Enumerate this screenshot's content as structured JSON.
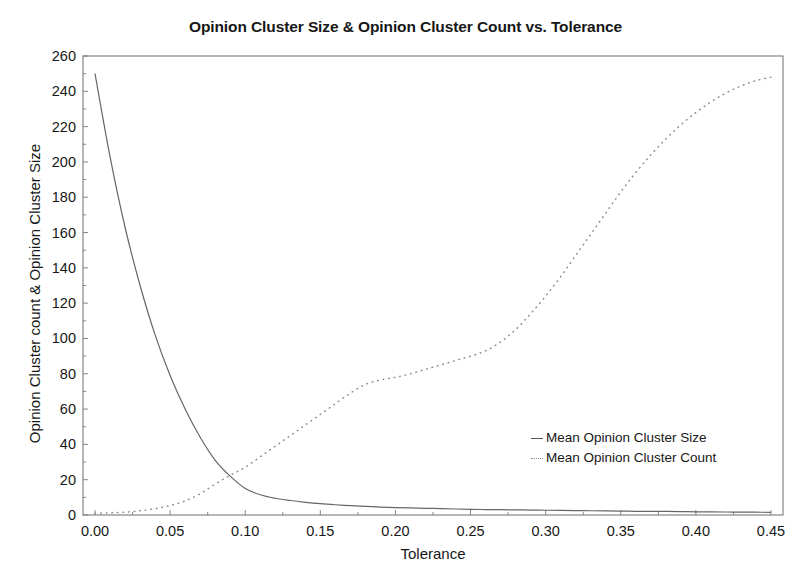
{
  "chart_data": {
    "type": "line",
    "title": "Opinion Cluster Size & Opinion Cluster Count vs. Tolerance",
    "xlabel": "Tolerance",
    "ylabel": "Opinion Cluster count & Opinion Cluster Size",
    "xlim": [
      -0.008,
      0.458
    ],
    "ylim": [
      0,
      260
    ],
    "grid": false,
    "legend_position": "center-right-inside",
    "xticks": [
      0.0,
      0.05,
      0.1,
      0.15,
      0.2,
      0.25,
      0.3,
      0.35,
      0.4,
      0.45
    ],
    "xtick_labels": [
      "0.00",
      "0.05",
      "0.10",
      "0.15",
      "0.20",
      "0.25",
      "0.30",
      "0.35",
      "0.40",
      "0.45"
    ],
    "yticks": [
      0,
      20,
      40,
      60,
      80,
      100,
      120,
      140,
      160,
      180,
      200,
      220,
      240,
      260
    ],
    "ytick_labels": [
      "0",
      "20",
      "40",
      "60",
      "80",
      "100",
      "120",
      "140",
      "160",
      "180",
      "200",
      "220",
      "240",
      "260"
    ],
    "x": [
      0.0,
      0.01,
      0.02,
      0.03,
      0.04,
      0.05,
      0.06,
      0.07,
      0.08,
      0.09,
      0.1,
      0.11,
      0.12,
      0.13,
      0.14,
      0.15,
      0.16,
      0.17,
      0.18,
      0.19,
      0.2,
      0.21,
      0.22,
      0.23,
      0.24,
      0.25,
      0.26,
      0.27,
      0.28,
      0.29,
      0.3,
      0.31,
      0.32,
      0.33,
      0.34,
      0.35,
      0.36,
      0.37,
      0.38,
      0.39,
      0.4,
      0.41,
      0.42,
      0.43,
      0.44,
      0.45
    ],
    "series": [
      {
        "name": "Mean Opinion Cluster Size",
        "style": "solid",
        "color": "#666666",
        "values": [
          250,
          203,
          163,
          130,
          102,
          79,
          60,
          44,
          31,
          22,
          15,
          11.5,
          9.5,
          8.2,
          7.2,
          6.4,
          5.8,
          5.3,
          4.9,
          4.5,
          4.2,
          4.0,
          3.8,
          3.6,
          3.4,
          3.2,
          3.1,
          3.0,
          2.9,
          2.8,
          2.7,
          2.6,
          2.5,
          2.4,
          2.3,
          2.2,
          2.1,
          2.0,
          2.0,
          1.9,
          1.8,
          1.8,
          1.7,
          1.6,
          1.6,
          1.5
        ]
      },
      {
        "name": "Mean Opinion Cluster Count",
        "style": "dotted",
        "color": "#8d8d8d",
        "values": [
          1.0,
          1.2,
          1.6,
          2.4,
          3.6,
          5.4,
          8.0,
          12.0,
          17.5,
          22.5,
          27.0,
          33.0,
          39.0,
          45.0,
          51.0,
          57.0,
          63.0,
          69.0,
          74.0,
          76.5,
          78.0,
          80.0,
          82.5,
          85.0,
          87.5,
          90.0,
          93.0,
          98.0,
          105.0,
          114.0,
          124.0,
          135.0,
          147.0,
          159.0,
          171.0,
          183.0,
          194.0,
          204.0,
          213.0,
          221.0,
          228.0,
          234.0,
          239.0,
          243.0,
          246.0,
          248.0
        ]
      }
    ]
  },
  "axes": {
    "frame_color": "#7a7a7a",
    "tick_color": "#7a7a7a",
    "background": "#ffffff"
  },
  "legend": {
    "items": [
      {
        "label": "Mean Opinion Cluster Size",
        "style": "solid"
      },
      {
        "label": "Mean Opinion Cluster Count",
        "style": "dotted"
      }
    ]
  },
  "caption": {
    "text": ""
  }
}
